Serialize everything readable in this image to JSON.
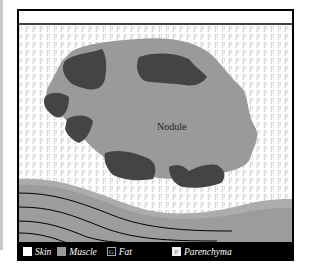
{
  "diagram": {
    "nodule_label": "Nodule",
    "pattern_glyph": "P",
    "colors": {
      "nodule": "#9a9a9a",
      "dark_patch": "#444444",
      "parenchyma_bg": "#ffffff",
      "pattern": "#c8c8c8",
      "muscle_light": "#acacac",
      "muscle": "#959595",
      "frame": "#000000"
    }
  },
  "legend": {
    "items": [
      {
        "label": "Skin",
        "swatch": ""
      },
      {
        "label": "Muscle",
        "swatch": ""
      },
      {
        "label": "Fat",
        "swatch": "G"
      },
      {
        "label": "Parenchyma",
        "swatch": "P"
      }
    ]
  }
}
